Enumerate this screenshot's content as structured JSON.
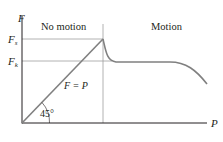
{
  "diagram": {
    "axes": {
      "y_label": "F",
      "x_label": "P"
    },
    "levels": {
      "static_label_main": "F",
      "static_label_sub": "s",
      "kinetic_label_main": "F",
      "kinetic_label_sub": "k"
    },
    "regions": {
      "left": "No motion",
      "right": "Motion"
    },
    "line_label": "F = P",
    "angle_label": "45°",
    "colors": {
      "axis": "#231f20",
      "curve": "#808080",
      "guide": "#9a9a9a",
      "text": "#231f20"
    }
  }
}
